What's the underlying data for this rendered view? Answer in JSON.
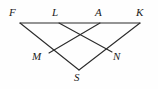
{
  "figure": {
    "kind": "geometry-diagram",
    "width": 158,
    "height": 89,
    "background_color": "#fefefe",
    "stroke_color": "#2b2b2b",
    "label_color": "#1a1a1a",
    "points": [
      {
        "name": "F",
        "label": "F",
        "x": 20,
        "y": 23,
        "label_x": 9,
        "label_y": 7
      },
      {
        "name": "L",
        "label": "L",
        "x": 59,
        "y": 23,
        "label_x": 52,
        "label_y": 7
      },
      {
        "name": "A",
        "label": "A",
        "x": 100,
        "y": 23,
        "label_x": 95,
        "label_y": 7
      },
      {
        "name": "K",
        "label": "K",
        "x": 140,
        "y": 23,
        "label_x": 136,
        "label_y": 7
      },
      {
        "name": "M",
        "label": "M",
        "x": 49,
        "y": 53,
        "label_x": 32,
        "label_y": 51
      },
      {
        "name": "N",
        "label": "N",
        "x": 112,
        "y": 52,
        "label_x": 113,
        "label_y": 51
      },
      {
        "name": "S",
        "label": "S",
        "x": 79,
        "y": 70,
        "label_x": 74,
        "label_y": 72
      }
    ],
    "segments": [
      {
        "name": "segment-FK",
        "from": "F",
        "to": "K",
        "x1": 20,
        "y1": 23,
        "x2": 140,
        "y2": 23
      },
      {
        "name": "segment-FS",
        "from": "F",
        "to": "S",
        "x1": 20,
        "y1": 23,
        "x2": 79,
        "y2": 70
      },
      {
        "name": "segment-KS",
        "from": "K",
        "to": "S",
        "x1": 140,
        "y1": 23,
        "x2": 79,
        "y2": 70
      },
      {
        "name": "segment-LN",
        "from": "L",
        "to": "N",
        "x1": 59,
        "y1": 23,
        "x2": 112,
        "y2": 52
      },
      {
        "name": "segment-AM",
        "from": "A",
        "to": "M",
        "x1": 100,
        "y1": 23,
        "x2": 49,
        "y2": 53
      }
    ]
  }
}
